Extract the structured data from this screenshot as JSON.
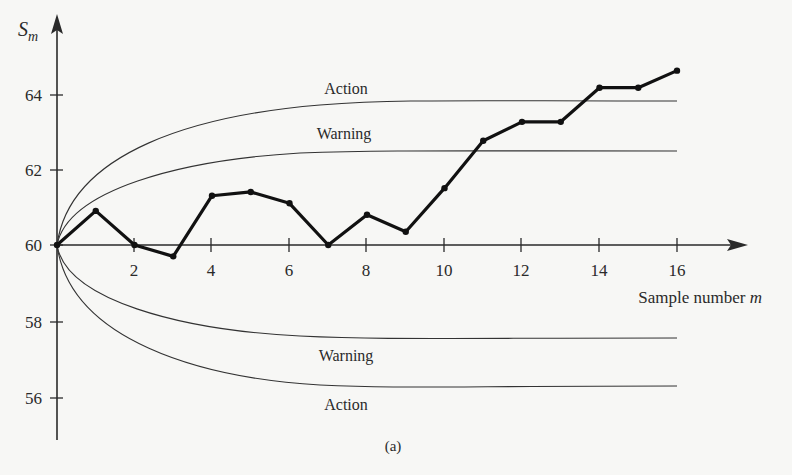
{
  "chart_data": {
    "type": "line",
    "title": "",
    "caption": "(a)",
    "xlabel": "Sample number m",
    "ylabel": "S_m",
    "xlim": [
      0,
      17
    ],
    "ylim": [
      55,
      65
    ],
    "x_ticks": [
      2,
      4,
      6,
      8,
      10,
      12,
      14,
      16
    ],
    "y_ticks": [
      56,
      58,
      60,
      62,
      64
    ],
    "grid": false,
    "legend": null,
    "series": [
      {
        "name": "S_m",
        "x": [
          0,
          1,
          2,
          3,
          4,
          5,
          6,
          7,
          8,
          9,
          10,
          11,
          12,
          13,
          14,
          15,
          16
        ],
        "values": [
          60.0,
          60.9,
          60.0,
          59.7,
          61.3,
          61.4,
          61.1,
          60.0,
          60.8,
          60.35,
          61.5,
          62.75,
          63.25,
          63.25,
          64.15,
          64.15,
          64.6
        ]
      }
    ],
    "limits": [
      {
        "name": "Action",
        "side": "upper",
        "asymptote": 63.8
      },
      {
        "name": "Warning",
        "side": "upper",
        "asymptote": 62.5
      },
      {
        "name": "Warning",
        "side": "lower",
        "asymptote": 57.5
      },
      {
        "name": "Action",
        "side": "lower",
        "asymptote": 56.2
      }
    ],
    "annotations": [
      "Action",
      "Warning",
      "Warning",
      "Action"
    ]
  },
  "labels": {
    "y_axis": "S",
    "y_axis_sub": "m",
    "x_axis": "Sample number ",
    "x_axis_var": "m",
    "caption": "(a)",
    "upper_action": "Action",
    "upper_warning": "Warning",
    "lower_warning": "Warning",
    "lower_action": "Action",
    "y_ticks": [
      "56",
      "58",
      "60",
      "62",
      "64"
    ],
    "x_ticks": [
      "2",
      "4",
      "6",
      "8",
      "10",
      "12",
      "14",
      "16"
    ]
  }
}
